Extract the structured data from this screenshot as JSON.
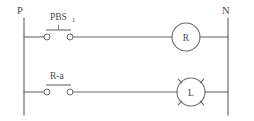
{
  "diagram": {
    "type": "ladder-logic-control-circuit",
    "rails": {
      "left": {
        "label": "P",
        "name": "power-line-rail"
      },
      "right": {
        "label": "N",
        "name": "neutral-line-rail"
      }
    },
    "rungs": [
      {
        "id": "rung-1",
        "contact": {
          "label": "PBS",
          "subscript": "1",
          "kind": "pushbutton-normally-open",
          "name": "pushbutton-pbs1"
        },
        "device": {
          "label": "R",
          "kind": "relay-coil",
          "name": "relay-coil-r"
        }
      },
      {
        "id": "rung-2",
        "contact": {
          "label": "R-a",
          "subscript": "",
          "kind": "relay-contact-normally-open",
          "name": "relay-contact-r-a"
        },
        "device": {
          "label": "L",
          "kind": "indicator-lamp",
          "name": "indicator-lamp-l"
        }
      }
    ],
    "colors": {
      "line": "#6b6b6b",
      "text": "#4a4a4a",
      "background": "#ffffff"
    }
  }
}
